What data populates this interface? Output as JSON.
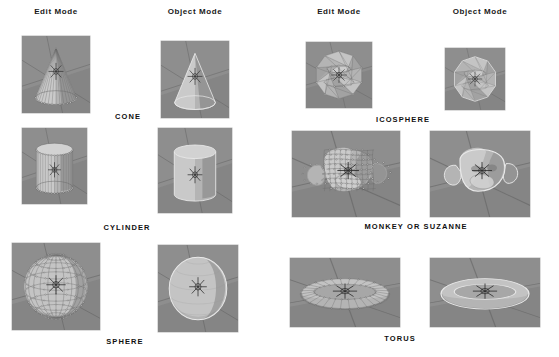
{
  "figure": {
    "columns": [
      {
        "id": "left-edit",
        "label": "Edit Mode"
      },
      {
        "id": "left-object",
        "label": "Object Mode"
      },
      {
        "id": "right-edit",
        "label": "Edit Mode"
      },
      {
        "id": "right-object",
        "label": "Object Mode"
      }
    ],
    "headers": [
      {
        "name": "header-left-edit",
        "label": "Edit Mode",
        "x": 22,
        "y": 7,
        "w": 68
      },
      {
        "name": "header-left-object",
        "label": "Object Mode",
        "x": 155,
        "y": 7,
        "w": 80
      },
      {
        "name": "header-right-edit",
        "label": "Edit Mode",
        "x": 305,
        "y": 7,
        "w": 68
      },
      {
        "name": "header-right-object",
        "label": "Object Mode",
        "x": 440,
        "y": 7,
        "w": 80
      }
    ],
    "captions": [
      {
        "name": "caption-cone",
        "label": "CONE",
        "x": 88,
        "y": 112,
        "w": 80
      },
      {
        "name": "caption-icosphere",
        "label": "ICOSPHERE",
        "x": 358,
        "y": 115,
        "w": 90
      },
      {
        "name": "caption-cylinder",
        "label": "CYLINDER",
        "x": 82,
        "y": 223,
        "w": 90
      },
      {
        "name": "caption-monkey",
        "label": "MONKEY OR SUZANNE",
        "x": 356,
        "y": 222,
        "w": 120
      },
      {
        "name": "caption-sphere",
        "label": "SPHERE",
        "x": 85,
        "y": 337,
        "w": 80
      },
      {
        "name": "caption-torus",
        "label": "TORUS",
        "x": 360,
        "y": 334,
        "w": 80
      }
    ],
    "thumbnails": [
      {
        "name": "thumb-cone-edit",
        "shape": "cone",
        "mode": "edit",
        "x": 22,
        "y": 36,
        "w": 68,
        "h": 77
      },
      {
        "name": "thumb-cone-object",
        "shape": "cone",
        "mode": "object",
        "x": 161,
        "y": 41,
        "w": 68,
        "h": 77
      },
      {
        "name": "thumb-icosphere-edit",
        "shape": "icosphere",
        "mode": "edit",
        "x": 306,
        "y": 42,
        "w": 66,
        "h": 66
      },
      {
        "name": "thumb-icosphere-object",
        "shape": "icosphere",
        "mode": "object",
        "x": 445,
        "y": 48,
        "w": 60,
        "h": 62
      },
      {
        "name": "thumb-cylinder-edit",
        "shape": "cylinder",
        "mode": "edit",
        "x": 22,
        "y": 128,
        "w": 65,
        "h": 76
      },
      {
        "name": "thumb-cylinder-object",
        "shape": "cylinder",
        "mode": "object",
        "x": 158,
        "y": 128,
        "w": 74,
        "h": 85
      },
      {
        "name": "thumb-monkey-edit",
        "shape": "monkey",
        "mode": "edit",
        "x": 292,
        "y": 131,
        "w": 108,
        "h": 86
      },
      {
        "name": "thumb-monkey-object",
        "shape": "monkey",
        "mode": "object",
        "x": 430,
        "y": 131,
        "w": 100,
        "h": 86
      },
      {
        "name": "thumb-sphere-edit",
        "shape": "sphere",
        "mode": "edit",
        "x": 12,
        "y": 243,
        "w": 88,
        "h": 87
      },
      {
        "name": "thumb-sphere-object",
        "shape": "sphere",
        "mode": "object",
        "x": 158,
        "y": 245,
        "w": 80,
        "h": 87
      },
      {
        "name": "thumb-torus-edit",
        "shape": "torus",
        "mode": "edit",
        "x": 290,
        "y": 258,
        "w": 110,
        "h": 69
      },
      {
        "name": "thumb-torus-object",
        "shape": "torus",
        "mode": "object",
        "x": 430,
        "y": 258,
        "w": 110,
        "h": 69
      }
    ]
  },
  "colors": {
    "page_background": "#ffffff",
    "viewport_background": "#8e8e8e",
    "viewport_floor_dark": "#7c7c7c",
    "grid_line": "#5f5f5f",
    "mesh_light": "#d2d2d2",
    "mesh_mid": "#b4b4b4",
    "mesh_dark": "#949494",
    "mesh_shadow": "#6f6f6f",
    "wireframe": "#6b6b6b",
    "vertex_highlight": "#efefef",
    "outline": "#e8e8e8",
    "cursor": "#2b2b2b",
    "text": "#111111"
  }
}
